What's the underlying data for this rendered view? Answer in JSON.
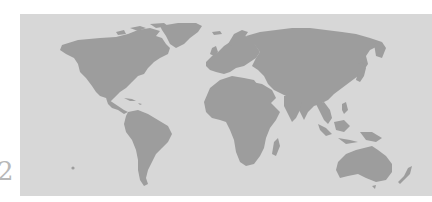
{
  "page": {
    "number": "2"
  },
  "map": {
    "type": "world-map",
    "projection": "equirectangular",
    "colors": {
      "ocean": "#d7d7d7",
      "land": "#9d9d9d",
      "page_background": "#ffffff",
      "page_number": "#b8b8b8"
    },
    "regions": [
      "north-america",
      "greenland",
      "south-america",
      "europe",
      "africa",
      "madagascar",
      "asia",
      "japan",
      "southeast-asia",
      "australia",
      "new-zealand",
      "antarctic-island-dot"
    ]
  }
}
